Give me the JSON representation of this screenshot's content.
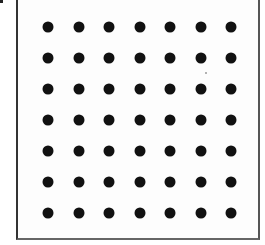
{
  "diagram": {
    "type": "dot-grid",
    "rows": 7,
    "columns": 7,
    "dot_color": "#111111",
    "frame_color": "#333333",
    "background": "#ffffff",
    "origin_px": [
      48,
      27
    ],
    "spacing_px": [
      30.5,
      31
    ]
  }
}
